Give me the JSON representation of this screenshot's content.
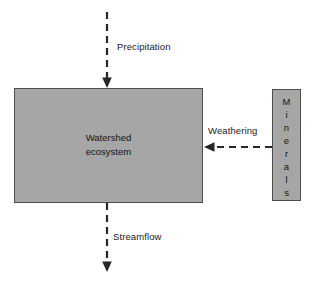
{
  "diagram": {
    "type": "block-flow-diagram",
    "background_color": "#ffffff",
    "box_fill_color": "#a6a6a6",
    "box_border_color": "#4d4d4d",
    "arrow_color": "#262626",
    "text_color": "#141414"
  },
  "boxes": {
    "watershed": {
      "name": "watershed-ecosystem",
      "line1": "Watershed",
      "line2": "ecosystem"
    },
    "minerals": {
      "name": "minerals",
      "label": "Minerals",
      "letters": [
        "M",
        "i",
        "n",
        "e",
        "r",
        "a",
        "l",
        "s"
      ],
      "orientation": "vertical-stacked"
    }
  },
  "flows": [
    {
      "name": "precipitation",
      "label": "Precipitation",
      "direction": "down",
      "target": "watershed-ecosystem",
      "style": "dashed-arrow"
    },
    {
      "name": "weathering",
      "label": "Weathering",
      "direction": "left",
      "source": "minerals",
      "target": "watershed-ecosystem",
      "style": "dashed-arrow"
    },
    {
      "name": "streamflow",
      "label": "Streamflow",
      "direction": "down",
      "source": "watershed-ecosystem",
      "style": "dashed-arrow"
    }
  ]
}
